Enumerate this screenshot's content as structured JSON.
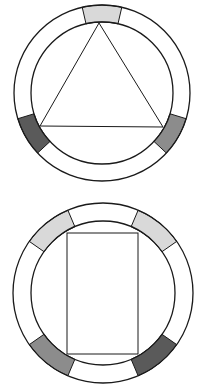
{
  "colors": {
    "stroke": "#1a1a1a",
    "background": "#ffffff",
    "light": "#d9d9d9",
    "medium": "#8c8c8c",
    "dark": "#5a5a5a",
    "empty": "#ffffff"
  },
  "diagrams": [
    {
      "name": "triangle-ring",
      "cx": 102,
      "cy": 93,
      "outer_r": 88,
      "inner_r": 71,
      "segments": [
        {
          "start": -13,
          "end": 13,
          "fill": "light"
        },
        {
          "start": 107,
          "end": 133,
          "fill": "medium"
        },
        {
          "start": 227,
          "end": 253,
          "fill": "dark"
        }
      ],
      "shape": {
        "type": "triangle",
        "points": [
          [
            99,
            23
          ],
          [
            40,
            126
          ],
          [
            163,
            127
          ]
        ]
      }
    },
    {
      "name": "rectangle-ring",
      "cx": 103,
      "cy": 293,
      "outer_r": 90,
      "inner_r": 72,
      "segments": [
        {
          "start": -55,
          "end": -23,
          "fill": "light"
        },
        {
          "start": 23,
          "end": 55,
          "fill": "light"
        },
        {
          "start": 125,
          "end": 157,
          "fill": "dark"
        },
        {
          "start": 203,
          "end": 235,
          "fill": "medium"
        }
      ],
      "dividers": [
        -23,
        23,
        157,
        203,
        -55,
        55,
        125,
        235
      ],
      "shape": {
        "type": "rect",
        "x": 67,
        "y": 233,
        "w": 71,
        "h": 121
      }
    }
  ]
}
